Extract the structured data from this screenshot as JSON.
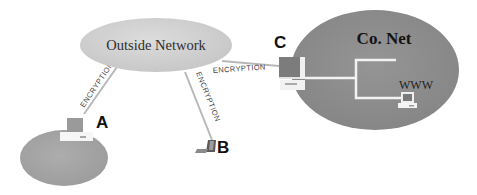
{
  "diagram": {
    "outside_network": {
      "label": "Outside Network",
      "fill": "#d2d2d2"
    },
    "corporate_network": {
      "label": "Co. Net",
      "fill": "#8e8e8e",
      "server_label": "WWW"
    },
    "home_network": {
      "fill": "#a6a6a6"
    },
    "nodes": [
      {
        "id": "A",
        "label": "A",
        "device": "desktop-computer"
      },
      {
        "id": "B",
        "label": "B",
        "device": "laptop"
      },
      {
        "id": "C",
        "label": "C",
        "device": "desktop-computer"
      }
    ],
    "links": [
      {
        "from": "Outside Network",
        "to": "A",
        "label": "ENCRYPTION"
      },
      {
        "from": "Outside Network",
        "to": "B",
        "label": "ENCRYPTION"
      },
      {
        "from": "Outside Network",
        "to": "C",
        "label": "ENCRYPTION"
      }
    ],
    "colors": {
      "link_line": "#b4b4b4",
      "link_text": "#3a3a3a",
      "node_label": "#111111",
      "wire": "#f2f2f2"
    }
  }
}
